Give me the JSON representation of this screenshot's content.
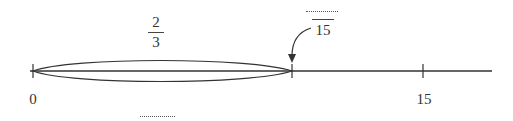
{
  "diagram": {
    "type": "number-line-fraction",
    "number_line": {
      "start_label": "0",
      "end_label": "15",
      "line_color": "#333333"
    },
    "ellipse": {
      "fraction": {
        "numerator": "2",
        "denominator": "3"
      }
    },
    "pointer_fraction": {
      "numerator_blank": "",
      "denominator": "15"
    },
    "answer_blank": ""
  }
}
